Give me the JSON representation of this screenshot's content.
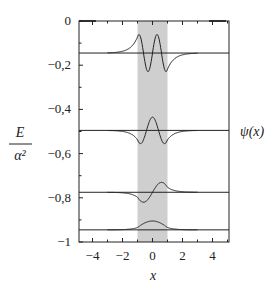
{
  "chart_data": {
    "type": "line",
    "title": "",
    "xlabel": "x",
    "ylabel": "E / α²",
    "right_label": "ψ(x)",
    "xlim": [
      -4.9,
      5.1
    ],
    "ylim": [
      -1,
      0
    ],
    "xticks": [
      -4,
      -2,
      0,
      2,
      4
    ],
    "xtick_labels": [
      "−4",
      "−2",
      "0",
      "2",
      "4"
    ],
    "yticks": [
      0,
      -0.2,
      -0.4,
      -0.6,
      -0.8,
      -1
    ],
    "ytick_labels": [
      "0",
      "−0,2",
      "−0,4",
      "−0,6",
      "−0,8",
      "−1"
    ],
    "grid": false,
    "shaded_region": {
      "x_from": -1,
      "x_to": 1,
      "color": "#cfcfcf"
    },
    "energy_levels": [
      {
        "E": -0.145,
        "nodes": 3,
        "label": "n=3"
      },
      {
        "E": -0.495,
        "nodes": 2,
        "label": "n=2"
      },
      {
        "E": -0.775,
        "nodes": 1,
        "label": "n=1"
      },
      {
        "E": -0.945,
        "nodes": 0,
        "label": "n=0"
      }
    ],
    "series": [
      {
        "name": "ψ3(x) at E≈-0.145",
        "description": "odd, 3 nodes inside well, decaying tails"
      },
      {
        "name": "ψ2(x) at E≈-0.495",
        "description": "even, 2 nodes, central peak"
      },
      {
        "name": "ψ1(x) at E≈-0.775",
        "description": "odd, 1 node"
      },
      {
        "name": "ψ0(x) at E≈-0.945",
        "description": "even, nodeless ground state"
      }
    ],
    "annotations": [
      "Diverging trial solutions fan out near the boundaries x≈±5"
    ]
  }
}
